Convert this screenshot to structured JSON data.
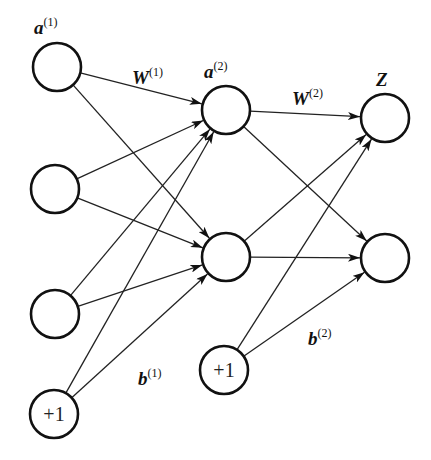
{
  "diagram": {
    "type": "feedforward-neural-network",
    "colors": {
      "stroke": "#111111",
      "background": "#ffffff"
    },
    "labels": {
      "input_layer": {
        "base": "a",
        "sup": "(1)"
      },
      "hidden_layer": {
        "base": "a",
        "sup": "(2)"
      },
      "output_layer": {
        "base": "Z",
        "sup": ""
      },
      "weights_1": {
        "base": "W",
        "sup": "(1)"
      },
      "weights_2": {
        "base": "W",
        "sup": "(2)"
      },
      "bias_1": {
        "base": "b",
        "sup": "(1)"
      },
      "bias_2": {
        "base": "b",
        "sup": "(2)"
      }
    },
    "nodes": [
      {
        "id": "in1",
        "layer": "input",
        "x": 57,
        "y": 67,
        "text": ""
      },
      {
        "id": "in2",
        "layer": "input",
        "x": 55,
        "y": 189,
        "text": ""
      },
      {
        "id": "in3",
        "layer": "input",
        "x": 55,
        "y": 314,
        "text": ""
      },
      {
        "id": "bias1",
        "layer": "input-bias",
        "x": 54,
        "y": 414,
        "text": "+1"
      },
      {
        "id": "h1",
        "layer": "hidden",
        "x": 226,
        "y": 110,
        "text": ""
      },
      {
        "id": "h2",
        "layer": "hidden",
        "x": 226,
        "y": 257,
        "text": ""
      },
      {
        "id": "bias2",
        "layer": "hidden-bias",
        "x": 224,
        "y": 370,
        "text": "+1"
      },
      {
        "id": "out1",
        "layer": "output",
        "x": 385,
        "y": 118,
        "text": ""
      },
      {
        "id": "out2",
        "layer": "output",
        "x": 385,
        "y": 258,
        "text": ""
      }
    ],
    "edges": [
      [
        "in1",
        "h1"
      ],
      [
        "in1",
        "h2"
      ],
      [
        "in2",
        "h1"
      ],
      [
        "in2",
        "h2"
      ],
      [
        "in3",
        "h1"
      ],
      [
        "in3",
        "h2"
      ],
      [
        "bias1",
        "h1"
      ],
      [
        "bias1",
        "h2"
      ],
      [
        "h1",
        "out1"
      ],
      [
        "h1",
        "out2"
      ],
      [
        "h2",
        "out1"
      ],
      [
        "h2",
        "out2"
      ],
      [
        "bias2",
        "out1"
      ],
      [
        "bias2",
        "out2"
      ]
    ]
  }
}
